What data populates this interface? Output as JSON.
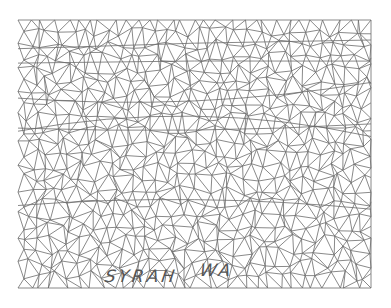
{
  "figure": {
    "type": "triangulated-irregular-network-wireframe",
    "line_color": "#6b6b6b",
    "background": "#ffffff",
    "bounds": {
      "x0": 18,
      "y0": 20,
      "x1": 371,
      "y1": 288
    }
  },
  "labels": [
    {
      "text": "SYRAH",
      "x": 105,
      "y": 268
    },
    {
      "text": "WA",
      "x": 200,
      "y": 262
    }
  ]
}
